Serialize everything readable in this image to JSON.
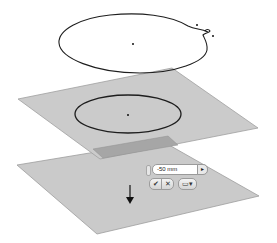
{
  "scene": {
    "colors": {
      "background": "#ffffff",
      "plane_fill": "#c9c9c9",
      "plane_edge": "#9a9a9a",
      "overlap_fill": "#a3a3a3",
      "sketch_line": "#222222"
    },
    "top_sketch": {
      "type": "closed-spline",
      "center_point": [
        133,
        44
      ]
    },
    "upper_plane": {
      "corners": [
        [
          18,
          99
        ],
        [
          172,
          68
        ],
        [
          258,
          128
        ],
        [
          100,
          159
        ]
      ],
      "sketch": {
        "type": "ellipse",
        "cx": 128,
        "cy": 114,
        "rx": 53,
        "ry": 19
      }
    },
    "lower_plane": {
      "corners": [
        [
          17,
          165
        ],
        [
          160,
          142
        ],
        [
          259,
          196
        ],
        [
          97,
          234
        ]
      ]
    },
    "direction_arrow": {
      "direction": "down",
      "x": 130,
      "y1": 183,
      "y2": 204
    }
  },
  "mini_toolbar": {
    "distance_value": "-50 mm",
    "apply_glyph": "▸",
    "ok_glyph": "✔",
    "cancel_glyph": "✕",
    "options_glyph": "▭▾"
  }
}
